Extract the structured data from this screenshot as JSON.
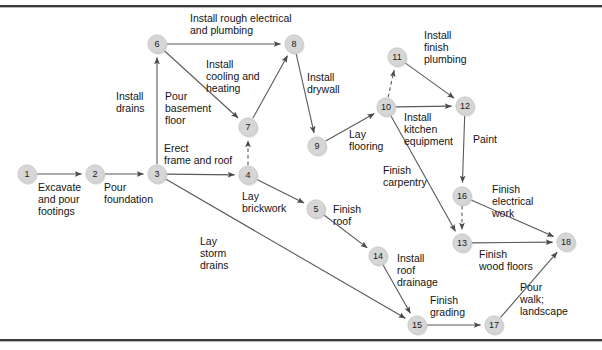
{
  "diagram": {
    "type": "activity-on-arrow-network",
    "colors": {
      "node_fill": "#d6d6d6",
      "node_stroke": "#c2c2c2",
      "edge_stroke": "#5a5a5a",
      "text": "#141414",
      "frame_rule": "#3a3a3a"
    },
    "nodes": [
      {
        "id": "1",
        "label": "1",
        "x": 27,
        "y": 174
      },
      {
        "id": "2",
        "label": "2",
        "x": 95,
        "y": 174
      },
      {
        "id": "3",
        "label": "3",
        "x": 157,
        "y": 174
      },
      {
        "id": "4",
        "label": "4",
        "x": 248,
        "y": 175
      },
      {
        "id": "5",
        "label": "5",
        "x": 316,
        "y": 209
      },
      {
        "id": "6",
        "label": "6",
        "x": 157,
        "y": 44
      },
      {
        "id": "7",
        "label": "7",
        "x": 248,
        "y": 127
      },
      {
        "id": "8",
        "label": "8",
        "x": 294,
        "y": 44
      },
      {
        "id": "9",
        "label": "9",
        "x": 317,
        "y": 146
      },
      {
        "id": "10",
        "label": "10",
        "x": 386,
        "y": 107
      },
      {
        "id": "11",
        "label": "11",
        "x": 397,
        "y": 57
      },
      {
        "id": "12",
        "label": "12",
        "x": 465,
        "y": 106
      },
      {
        "id": "13",
        "label": "13",
        "x": 462,
        "y": 243
      },
      {
        "id": "14",
        "label": "14",
        "x": 378,
        "y": 256
      },
      {
        "id": "15",
        "label": "15",
        "x": 417,
        "y": 325
      },
      {
        "id": "16",
        "label": "16",
        "x": 462,
        "y": 196
      },
      {
        "id": "17",
        "label": "17",
        "x": 494,
        "y": 325
      },
      {
        "id": "18",
        "label": "18",
        "x": 566,
        "y": 242
      }
    ],
    "edges": [
      {
        "id": "e1",
        "from": "1",
        "to": "2",
        "style": "solid",
        "activity": "Excavate and pour footings"
      },
      {
        "id": "e2",
        "from": "2",
        "to": "3",
        "style": "solid",
        "activity": "Pour foundation"
      },
      {
        "id": "e3",
        "from": "3",
        "to": "6",
        "style": "solid",
        "activity": "Install drains"
      },
      {
        "id": "e4",
        "from": "3",
        "to": "4",
        "style": "solid",
        "activity": "Erect frame and roof"
      },
      {
        "id": "e5",
        "from": "3",
        "to": "15",
        "style": "solid",
        "activity": "Lay storm drains"
      },
      {
        "id": "e6",
        "from": "4",
        "to": "7",
        "style": "dashed",
        "activity": ""
      },
      {
        "id": "e7",
        "from": "4",
        "to": "5",
        "style": "solid",
        "activity": "Lay brickwork"
      },
      {
        "id": "e8",
        "from": "6",
        "to": "8",
        "style": "solid",
        "activity": "Install rough electrical and plumbing"
      },
      {
        "id": "e9",
        "from": "6",
        "to": "7",
        "style": "solid",
        "activity": "Pour basement floor"
      },
      {
        "id": "e10",
        "from": "7",
        "to": "8",
        "style": "solid",
        "activity": "Install cooling and heating"
      },
      {
        "id": "e11",
        "from": "8",
        "to": "9",
        "style": "solid",
        "activity": "Install drywall"
      },
      {
        "id": "e12",
        "from": "9",
        "to": "10",
        "style": "solid",
        "activity": "Lay flooring"
      },
      {
        "id": "e13",
        "from": "10",
        "to": "11",
        "style": "dashed",
        "activity": ""
      },
      {
        "id": "e14",
        "from": "10",
        "to": "12",
        "style": "solid",
        "activity": "Install kitchen equipment"
      },
      {
        "id": "e15",
        "from": "11",
        "to": "12",
        "style": "solid",
        "activity": "Install finish plumbing"
      },
      {
        "id": "e16",
        "from": "10",
        "to": "13",
        "style": "solid",
        "activity": "Finish carpentry"
      },
      {
        "id": "e17",
        "from": "12",
        "to": "16",
        "style": "solid",
        "activity": "Paint"
      },
      {
        "id": "e18",
        "from": "16",
        "to": "13",
        "style": "dashed",
        "activity": ""
      },
      {
        "id": "e19",
        "from": "16",
        "to": "18",
        "style": "solid",
        "activity": "Finish electrical work"
      },
      {
        "id": "e20",
        "from": "13",
        "to": "18",
        "style": "solid",
        "activity": "Finish wood floors"
      },
      {
        "id": "e21",
        "from": "5",
        "to": "14",
        "style": "solid",
        "activity": "Finish roof"
      },
      {
        "id": "e22",
        "from": "14",
        "to": "15",
        "style": "solid",
        "activity": "Install roof drainage"
      },
      {
        "id": "e23",
        "from": "15",
        "to": "17",
        "style": "solid",
        "activity": "Finish grading"
      },
      {
        "id": "e24",
        "from": "17",
        "to": "18",
        "style": "solid",
        "activity": "Pour walk; landscape"
      }
    ],
    "labels": [
      {
        "id": "l1",
        "text": "Install rough electrical\nand plumbing",
        "x": 190,
        "y": 12,
        "align": "left"
      },
      {
        "id": "l2",
        "text": "Install\ncooling and\nheating",
        "x": 206,
        "y": 58,
        "align": "left"
      },
      {
        "id": "l3",
        "text": "Install\ndrywall",
        "x": 307,
        "y": 71,
        "align": "left"
      },
      {
        "id": "l4",
        "text": "Install\nfinish\nplumbing",
        "x": 424,
        "y": 29,
        "align": "left"
      },
      {
        "id": "l5",
        "text": "Install\ndrains",
        "x": 116,
        "y": 90,
        "align": "left"
      },
      {
        "id": "l6",
        "text": "Pour\nbasement\nfloor",
        "x": 165,
        "y": 90,
        "align": "left"
      },
      {
        "id": "l7",
        "text": "Install\nkitchen\nequipment",
        "x": 404,
        "y": 111,
        "align": "left"
      },
      {
        "id": "l8",
        "text": "Lay\nflooring",
        "x": 349,
        "y": 128,
        "align": "left"
      },
      {
        "id": "l9",
        "text": "Paint",
        "x": 473,
        "y": 133,
        "align": "left"
      },
      {
        "id": "l10",
        "text": "Erect\nframe and roof",
        "x": 164,
        "y": 142,
        "align": "left"
      },
      {
        "id": "l11",
        "text": "Excavate\nand pour\nfootings",
        "x": 38,
        "y": 181,
        "align": "left"
      },
      {
        "id": "l12",
        "text": "Pour\nfoundation",
        "x": 104,
        "y": 181,
        "align": "left"
      },
      {
        "id": "l13",
        "text": "Lay\nbrickwork",
        "x": 242,
        "y": 190,
        "align": "left"
      },
      {
        "id": "l14",
        "text": "Finish\ncarpentry",
        "x": 383,
        "y": 164,
        "align": "left"
      },
      {
        "id": "l15",
        "text": "Finish\nelectrical\nwork",
        "x": 492,
        "y": 183,
        "align": "left"
      },
      {
        "id": "l16",
        "text": "Finish\nroof",
        "x": 333,
        "y": 203,
        "align": "left"
      },
      {
        "id": "l17",
        "text": "Lay\nstorm\ndrains",
        "x": 200,
        "y": 235,
        "align": "left"
      },
      {
        "id": "l18",
        "text": "Install\nroof\ndrainage",
        "x": 397,
        "y": 252,
        "align": "left"
      },
      {
        "id": "l19",
        "text": "Finish\nwood floors",
        "x": 479,
        "y": 248,
        "align": "left"
      },
      {
        "id": "l20",
        "text": "Finish\ngrading",
        "x": 430,
        "y": 294,
        "align": "left"
      },
      {
        "id": "l21",
        "text": "Pour\nwalk;\nlandscape",
        "x": 520,
        "y": 281,
        "align": "left"
      }
    ]
  }
}
